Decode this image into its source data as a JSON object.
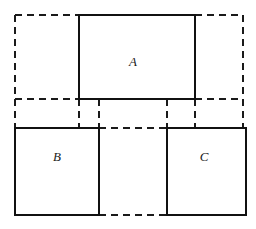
{
  "figure": {
    "type": "geometric-diagram",
    "canvas": {
      "width": 256,
      "height": 229,
      "background": "#ffffff"
    },
    "colors": {
      "solid_stroke": "#111111",
      "dashed_stroke": "#1a1a1a",
      "fill": "#ffffff",
      "label_color": "#1a1a1a"
    },
    "stroke_widths": {
      "solid": 2.1,
      "dashed": 1.7
    },
    "dash_pattern": "7 5",
    "solid_rects": [
      {
        "id": "rect-a",
        "label": "A",
        "x": 79,
        "y": 15,
        "width": 116,
        "height": 84,
        "label_x": 133,
        "label_y": 63
      },
      {
        "id": "rect-b",
        "label": "B",
        "x": 15,
        "y": 128,
        "width": 84,
        "height": 87,
        "label_x": 57,
        "label_y": 158
      },
      {
        "id": "rect-c",
        "label": "C",
        "x": 167,
        "y": 128,
        "width": 79,
        "height": 87,
        "label_x": 204,
        "label_y": 158
      }
    ],
    "dashed_lines": [
      {
        "id": "outer-top",
        "x1": 15,
        "y1": 15,
        "x2": 79,
        "y2": 15
      },
      {
        "id": "outer-top-right",
        "x1": 195,
        "y1": 15,
        "x2": 243,
        "y2": 15
      },
      {
        "id": "outer-left",
        "x1": 15,
        "y1": 15,
        "x2": 15,
        "y2": 128
      },
      {
        "id": "outer-right",
        "x1": 243,
        "y1": 15,
        "x2": 243,
        "y2": 128
      },
      {
        "id": "mid-horizontal",
        "x1": 15,
        "y1": 99,
        "x2": 243,
        "y2": 99
      },
      {
        "id": "band-vert-a-left",
        "x1": 79,
        "y1": 99,
        "x2": 79,
        "y2": 128
      },
      {
        "id": "band-vert-a-right",
        "x1": 195,
        "y1": 99,
        "x2": 195,
        "y2": 128
      },
      {
        "id": "inner-vert-b",
        "x1": 99,
        "y1": 99,
        "x2": 99,
        "y2": 215
      },
      {
        "id": "inner-vert-c",
        "x1": 167,
        "y1": 99,
        "x2": 167,
        "y2": 215
      },
      {
        "id": "inner-top-gap",
        "x1": 99,
        "y1": 128,
        "x2": 167,
        "y2": 128
      },
      {
        "id": "inner-bottom-gap",
        "x1": 99,
        "y1": 215,
        "x2": 167,
        "y2": 215
      }
    ],
    "labels": [
      {
        "id": "label-a",
        "text": "A",
        "x": 133,
        "y": 63
      },
      {
        "id": "label-b",
        "text": "B",
        "x": 57,
        "y": 158
      },
      {
        "id": "label-c",
        "text": "C",
        "x": 204,
        "y": 158
      }
    ]
  }
}
